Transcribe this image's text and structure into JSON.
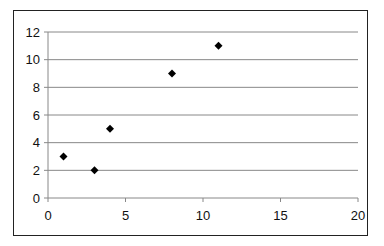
{
  "chart_data": {
    "type": "scatter",
    "title": "",
    "xlabel": "",
    "ylabel": "",
    "xlim": [
      0,
      20
    ],
    "ylim": [
      0,
      12
    ],
    "x_ticks": [
      "0",
      "5",
      "10",
      "15",
      "20"
    ],
    "y_ticks": [
      "0",
      "2",
      "4",
      "6",
      "8",
      "10",
      "12"
    ],
    "grid": "horizontal",
    "legend": "none",
    "marker": "diamond",
    "series": [
      {
        "name": "Series 1",
        "points": [
          [
            1,
            3
          ],
          [
            3,
            2
          ],
          [
            4,
            5
          ],
          [
            8,
            9
          ],
          [
            11,
            11
          ]
        ]
      }
    ]
  },
  "colors": {
    "marker": "#000000",
    "grid": "#888888",
    "frame": "#222222"
  }
}
